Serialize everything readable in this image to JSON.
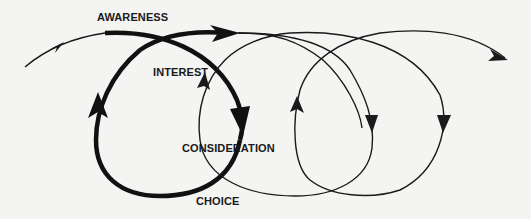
{
  "diagram": {
    "title": "",
    "stages": [
      {
        "id": "awareness",
        "label": "AWARENESS"
      },
      {
        "id": "interest",
        "label": "INTEREST"
      },
      {
        "id": "consideration",
        "label": "CONSIDERATION"
      },
      {
        "id": "choice",
        "label": "CHOICE"
      }
    ],
    "colors": {
      "background": "#f4f4f2",
      "stroke": "#1a1a1a",
      "text": "#1a1a1a"
    }
  }
}
